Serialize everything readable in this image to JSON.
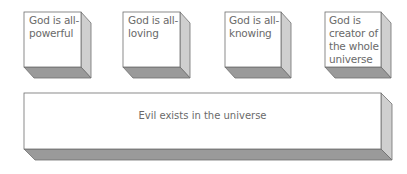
{
  "diagram": {
    "type": "3d-blocks",
    "colors": {
      "front": "#ffffff",
      "side": "#cfcfcf",
      "bottom": "#9a9a9a",
      "edge": "#6e6e6e",
      "text": "#6a6a6a"
    },
    "top_blocks": [
      {
        "label": "God is all-\npowerful"
      },
      {
        "label": "God is all-\nloving"
      },
      {
        "label": "God is all-\nknowing"
      },
      {
        "label": "God is\ncreator of\nthe whole\nuniverse"
      }
    ],
    "base_block": {
      "label": "Evil exists in the universe"
    }
  }
}
